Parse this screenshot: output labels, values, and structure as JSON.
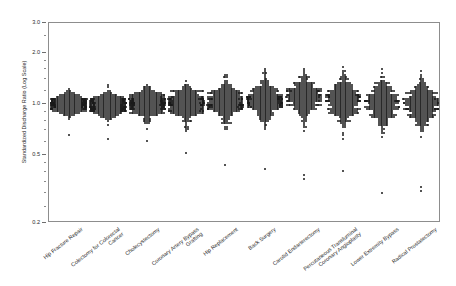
{
  "chart": {
    "type": "strip",
    "title": "",
    "xlabel": "",
    "ylabel": "Standardized Discharge Ratio (Log Scale)",
    "yscale": "log",
    "ylim": [
      0.2,
      3.0
    ],
    "grid": false,
    "legend": "none",
    "frame": true,
    "y_tick_labels": [
      "3.0",
      "2.0",
      "1.0",
      "0.5",
      "0.2"
    ],
    "y_tick_values": [
      3.0,
      2.0,
      1.0,
      0.5,
      0.2
    ],
    "y_minor_tick_values": [
      2.5,
      1.8,
      1.6,
      1.4,
      1.2,
      0.9,
      0.8,
      0.7,
      0.6,
      0.45,
      0.4,
      0.35,
      0.3,
      0.25
    ],
    "categories": [
      "Hip Fracture Repair",
      "Colectomy for Colorectal Cancer",
      "Cholecystectomy",
      "Coronary Artery Bypass Grafting",
      "Hip Replacement",
      "Back Surgery",
      "Carotid Endarterectomy",
      "Percutaneous Transluminal Coronary Angioplasty",
      "Lower Extremity Bypass",
      "Radical Prostatectomy"
    ],
    "category_labels_wrapped": [
      [
        "Hip Fracture Repair",
        ""
      ],
      [
        "Colectomy for Colorectal",
        "Cancer"
      ],
      [
        "Cholecystectomy",
        ""
      ],
      [
        "Coronary Artery Bypass",
        "Grafting"
      ],
      [
        "Hip Replacement",
        ""
      ],
      [
        "Back Surgery",
        ""
      ],
      [
        "Carotid Endarterectomy",
        ""
      ],
      [
        "Percutaneous Transluminal",
        "Coronary Angioplasty"
      ],
      [
        "Lower Extremity Bypass",
        ""
      ],
      [
        "Radical Prostatectomy",
        ""
      ]
    ],
    "series": [
      {
        "name": "Hip Fracture Repair",
        "n": 300,
        "median": 1.0,
        "spread_log_sd": 0.072,
        "min": 0.66,
        "max": 1.42,
        "outliers": [
          0.66
        ]
      },
      {
        "name": "Colectomy for Colorectal Cancer",
        "n": 320,
        "median": 0.98,
        "spread_log_sd": 0.086,
        "min": 0.62,
        "max": 1.45,
        "outliers": [
          0.62
        ]
      },
      {
        "name": "Cholecystectomy",
        "n": 340,
        "median": 1.0,
        "spread_log_sd": 0.105,
        "min": 0.6,
        "max": 1.75,
        "outliers": [
          0.6
        ]
      },
      {
        "name": "Coronary Artery Bypass Grafting",
        "n": 330,
        "median": 1.01,
        "spread_log_sd": 0.118,
        "min": 0.52,
        "max": 1.9,
        "outliers": [
          0.52
        ]
      },
      {
        "name": "Hip Replacement",
        "n": 320,
        "median": 1.02,
        "spread_log_sd": 0.128,
        "min": 0.44,
        "max": 1.8,
        "outliers": [
          0.44
        ]
      },
      {
        "name": "Back Surgery",
        "n": 340,
        "median": 1.05,
        "spread_log_sd": 0.15,
        "min": 0.42,
        "max": 2.25,
        "outliers": [
          0.42
        ]
      },
      {
        "name": "Carotid Endarterectomy",
        "n": 300,
        "median": 1.1,
        "spread_log_sd": 0.15,
        "min": 0.38,
        "max": 2.1,
        "outliers": [
          0.38,
          0.36
        ]
      },
      {
        "name": "Percutaneous Transluminal Coronary Angioplasty",
        "n": 330,
        "median": 1.05,
        "spread_log_sd": 0.16,
        "min": 0.4,
        "max": 2.3,
        "outliers": [
          0.4
        ]
      },
      {
        "name": "Lower Extremity Bypass",
        "n": 310,
        "median": 1.02,
        "spread_log_sd": 0.15,
        "min": 0.3,
        "max": 2.05,
        "outliers": [
          0.3
        ]
      },
      {
        "name": "Radical Prostatectomy",
        "n": 320,
        "median": 1.0,
        "spread_log_sd": 0.155,
        "min": 0.33,
        "max": 2.25,
        "outliers": [
          0.33,
          0.31
        ]
      }
    ]
  }
}
